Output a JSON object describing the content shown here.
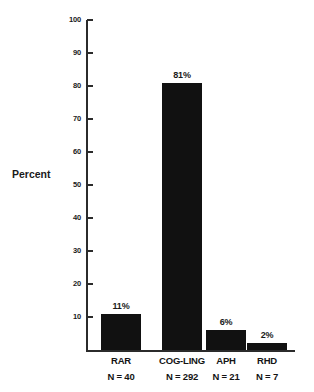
{
  "chart_data": {
    "type": "bar",
    "title": "",
    "xlabel": "",
    "ylabel": "Percent",
    "ylim": [
      0,
      100
    ],
    "grid": false,
    "legend": false,
    "categories": [
      "RAR",
      "COG-LING",
      "APH",
      "RHD"
    ],
    "values": [
      11,
      81,
      6,
      2
    ],
    "value_labels": [
      "11%",
      "81%",
      "6%",
      "2%"
    ],
    "group_sizes": [
      "N = 40",
      "N = 292",
      "N = 21",
      "N = 7"
    ],
    "ytick_labels": [
      "100",
      "90",
      "80",
      "70",
      "60",
      "50",
      "40",
      "30",
      "20",
      "10"
    ],
    "ytick_values": [
      100,
      90,
      80,
      70,
      60,
      50,
      40,
      30,
      20,
      10
    ],
    "bar_color": "#111111",
    "axis_color": "#2b2b2b",
    "background_color": "#ffffff"
  }
}
